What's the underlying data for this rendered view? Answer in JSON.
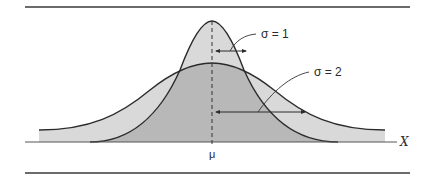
{
  "diagram": {
    "type": "normal-distribution-comparison",
    "axis_label": "X",
    "mean_label": "μ",
    "curves": [
      {
        "id": "narrow",
        "label": "σ = 1",
        "sigma": 1
      },
      {
        "id": "wide",
        "label": "σ = 2",
        "sigma": 2
      }
    ],
    "colors": {
      "line": "#2b2b2b",
      "light_fill": "#d9d9d9",
      "dark_fill": "#b8b8b8",
      "rule": "#3a3a3a"
    }
  }
}
